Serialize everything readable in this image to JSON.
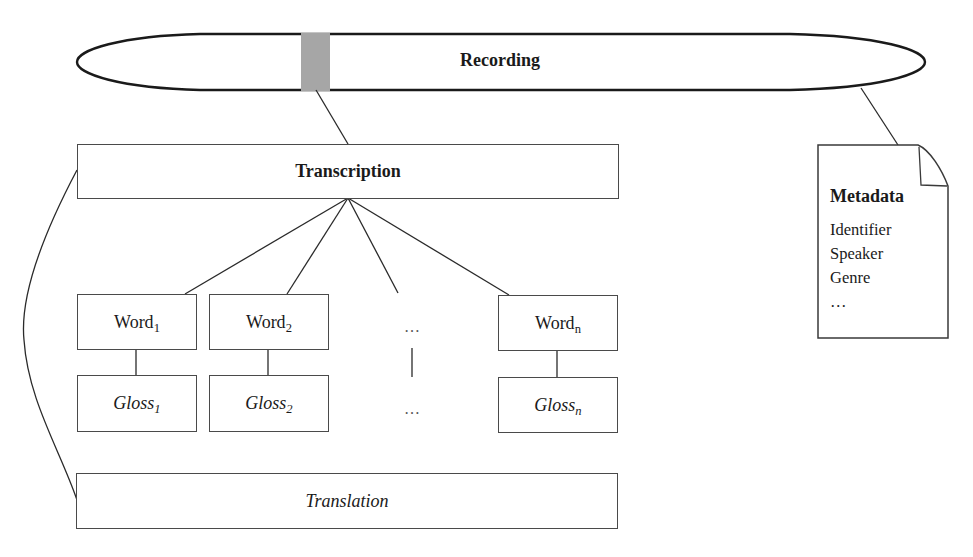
{
  "diagram": {
    "recording": {
      "label": "Recording",
      "segment_color": "#a6a6a6"
    },
    "transcription": {
      "label": "Transcription"
    },
    "words": [
      {
        "label": "Word",
        "sub": "1",
        "gloss": "Gloss",
        "gloss_sub": "1"
      },
      {
        "label": "Word",
        "sub": "2",
        "gloss": "Gloss",
        "gloss_sub": "2"
      },
      {
        "label": "…",
        "sub": "",
        "gloss": "…",
        "gloss_sub": ""
      },
      {
        "label": "Word",
        "sub": "n",
        "gloss": "Gloss",
        "gloss_sub": "n"
      }
    ],
    "translation": {
      "label": "Translation"
    },
    "metadata": {
      "title": "Metadata",
      "items": [
        "Identifier",
        "Speaker",
        "Genre",
        "…"
      ]
    },
    "colors": {
      "stroke": "#2a2a2a",
      "box_stroke": "#4a4a4a",
      "background": "#ffffff"
    }
  }
}
